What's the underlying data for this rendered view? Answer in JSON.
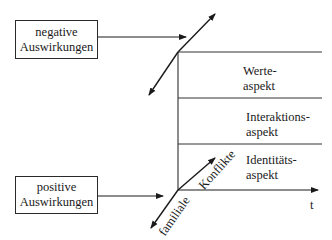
{
  "boxes": {
    "negative": {
      "line1": "negative",
      "line2": "Auswirkungen"
    },
    "positive": {
      "line1": "positive",
      "line2": "Auswirkungen"
    }
  },
  "aspects": [
    {
      "line1": "Werte-",
      "line2": "aspekt"
    },
    {
      "line1": "Interaktions-",
      "line2": "aspekt"
    },
    {
      "line1": "Identitäts-",
      "line2": "aspekt"
    }
  ],
  "axis": {
    "time_label": "t",
    "diagonal_label_upper": "Konflikte",
    "diagonal_label_lower": "familiale"
  },
  "colors": {
    "line": "#1a1a1a",
    "background": "#ffffff"
  }
}
